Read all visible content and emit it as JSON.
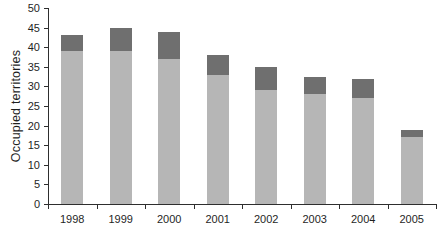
{
  "figure": {
    "background": "#ffffff"
  },
  "chart_data": {
    "type": "bar",
    "stacked": true,
    "title": "",
    "xlabel": "",
    "ylabel": "Occupied territories",
    "categories": [
      "1998",
      "1999",
      "2000",
      "2001",
      "2002",
      "2003",
      "2004",
      "2005"
    ],
    "series": [
      {
        "name": "light-gray-segment",
        "color": "#b6b6b6",
        "values": [
          39,
          39,
          37,
          33,
          29,
          28,
          27,
          17
        ]
      },
      {
        "name": "dark-gray-segment",
        "color": "#6f6f6f",
        "values": [
          4,
          6,
          7,
          5,
          6,
          4.5,
          5,
          2
        ]
      }
    ],
    "totals": [
      43,
      45,
      44,
      38,
      35,
      32.5,
      32,
      19
    ],
    "ylim": [
      0,
      50
    ],
    "y_ticks": [
      0,
      5,
      10,
      15,
      20,
      25,
      30,
      35,
      40,
      45,
      50
    ],
    "grid": false,
    "legend": "none"
  },
  "colors": {
    "axis": "#2e2e2e",
    "text": "#1f1f1f"
  }
}
